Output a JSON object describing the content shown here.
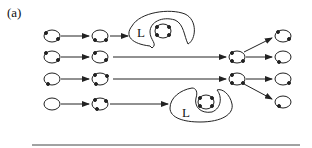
{
  "figure": {
    "panel_label": "(a)",
    "loop_label_top": "L",
    "loop_label_bottom": "L",
    "colors": {
      "stroke": "#222222",
      "background": "#ffffff"
    },
    "nodes": [
      {
        "id": "r1c1",
        "cx": 52,
        "cy": 36
      },
      {
        "id": "r1c2",
        "cx": 100,
        "cy": 36
      },
      {
        "id": "r2c1",
        "cx": 52,
        "cy": 57
      },
      {
        "id": "r2c2",
        "cx": 100,
        "cy": 57
      },
      {
        "id": "r3c1",
        "cx": 52,
        "cy": 79
      },
      {
        "id": "r3c2",
        "cx": 100,
        "cy": 79
      },
      {
        "id": "r4c1",
        "cx": 52,
        "cy": 104
      },
      {
        "id": "r4c2",
        "cx": 100,
        "cy": 104
      },
      {
        "id": "m1",
        "cx": 237,
        "cy": 57
      },
      {
        "id": "m2",
        "cx": 237,
        "cy": 79
      },
      {
        "id": "o1",
        "cx": 283,
        "cy": 36
      },
      {
        "id": "o2",
        "cx": 283,
        "cy": 57
      },
      {
        "id": "o3",
        "cx": 283,
        "cy": 79
      },
      {
        "id": "o4",
        "cx": 283,
        "cy": 102
      },
      {
        "id": "loop_top_inner",
        "cx": 163,
        "cy": 30
      },
      {
        "id": "loop_bottom_inner",
        "cx": 206,
        "cy": 102
      }
    ],
    "edges": [
      [
        "r1c1",
        "r1c2"
      ],
      [
        "r1c2",
        "loop_top"
      ],
      [
        "r2c1",
        "r2c2"
      ],
      [
        "r2c2",
        "m1"
      ],
      [
        "r3c1",
        "r3c2"
      ],
      [
        "r3c2",
        "m2"
      ],
      [
        "r4c1",
        "r4c2"
      ],
      [
        "r4c2",
        "loop_bottom"
      ],
      [
        "m1",
        "o1"
      ],
      [
        "m1",
        "o2"
      ],
      [
        "m2",
        "o3"
      ],
      [
        "m2",
        "o4"
      ]
    ]
  }
}
